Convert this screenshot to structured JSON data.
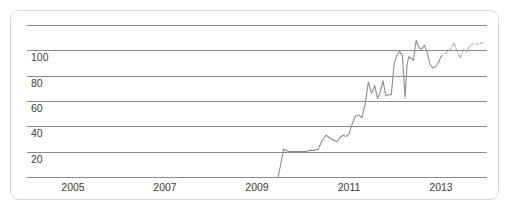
{
  "card": {
    "border_color": "#d8d8d8",
    "background_color": "#ffffff"
  },
  "chart_data": {
    "type": "line",
    "title": "",
    "subtitle": "",
    "xlabel": "",
    "ylabel": "",
    "grid": true,
    "legend": "none",
    "line_color": "#8d8d8d",
    "grid_color": "#8a8a8a",
    "forecast_color": "#a8a8a8",
    "xlim": [
      2004.0,
      2014.0
    ],
    "ylim": [
      0,
      120
    ],
    "y_ticks": [
      20,
      40,
      60,
      80,
      100
    ],
    "y_gridlines": [
      0,
      20,
      40,
      60,
      80,
      100,
      120
    ],
    "y_tick_labels": [
      "20",
      "40",
      "60",
      "80",
      "100"
    ],
    "x_ticks": [
      2005,
      2007,
      2009,
      2011,
      2013
    ],
    "x_tick_labels": [
      "2005",
      "2007",
      "2009",
      "2011",
      "2013"
    ],
    "series": [
      {
        "name": "observed",
        "style": "solid",
        "x": [
          2009.46,
          2009.52,
          2009.58,
          2009.64,
          2009.7,
          2009.78,
          2009.86,
          2009.95,
          2010.04,
          2010.14,
          2010.24,
          2010.33,
          2010.42,
          2010.5,
          2010.58,
          2010.66,
          2010.74,
          2010.8,
          2010.87,
          2010.94,
          2011.0,
          2011.07,
          2011.14,
          2011.21,
          2011.28,
          2011.35,
          2011.42,
          2011.49,
          2011.56,
          2011.62,
          2011.68,
          2011.74,
          2011.8,
          2011.86,
          2011.92,
          2011.98,
          2012.04,
          2012.1,
          2012.16,
          2012.22,
          2012.26,
          2012.3,
          2012.34,
          2012.4,
          2012.46,
          2012.52,
          2012.58,
          2012.64,
          2012.7,
          2012.76,
          2012.82,
          2012.88,
          2012.94,
          2013.0
        ],
        "y": [
          0,
          11,
          22,
          21,
          20,
          20,
          20,
          20,
          20,
          21,
          21,
          22,
          29,
          33,
          31,
          29,
          28,
          31,
          33,
          32,
          34,
          42,
          48,
          49,
          47,
          57,
          75,
          66,
          72,
          62,
          67,
          76,
          64,
          65,
          65,
          89,
          96,
          99,
          96,
          63,
          88,
          95,
          94,
          92,
          108,
          102,
          101,
          104,
          98,
          89,
          86,
          87,
          90,
          95
        ]
      },
      {
        "name": "forecast",
        "style": "dashed",
        "x": [
          2013.0,
          2013.07,
          2013.14,
          2013.21,
          2013.28,
          2013.35,
          2013.42,
          2013.49,
          2013.56,
          2013.63,
          2013.7,
          2013.77,
          2013.84,
          2013.9
        ],
        "y": [
          95,
          97,
          99,
          101,
          106,
          99,
          94,
          101,
          99,
          104,
          105,
          105,
          105,
          106
        ]
      }
    ]
  }
}
